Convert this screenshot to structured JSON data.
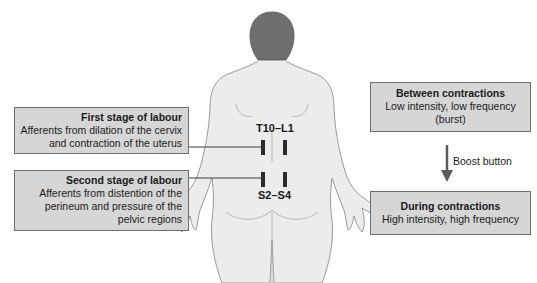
{
  "diagram": {
    "colors": {
      "box_fill": "#d6d6d6",
      "box_border": "#6d6d6d",
      "body_fill": "#ececec",
      "body_outline": "#9a9a9a",
      "hair": "#6f6f6f",
      "electrode": "#2a2a2a",
      "arrow": "#5a5a5a"
    },
    "left_boxes": [
      {
        "title": "First stage of labour",
        "lines": [
          "Afferents from dilation of the cervix",
          "and contraction of the uterus"
        ]
      },
      {
        "title": "Second stage of labour",
        "lines": [
          "Afferents from distention of the",
          "perineum and pressure of the",
          "pelvic regions"
        ]
      }
    ],
    "spinal_labels": {
      "upper": "T10–L1",
      "lower": "S2–S4"
    },
    "right_boxes": [
      {
        "title": "Between contractions",
        "lines": [
          "Low intensity, low frequency",
          "(burst)"
        ]
      },
      {
        "title": "During contractions",
        "lines": [
          "High intensity, high frequency"
        ]
      }
    ],
    "arrow_label": "Boost button"
  }
}
